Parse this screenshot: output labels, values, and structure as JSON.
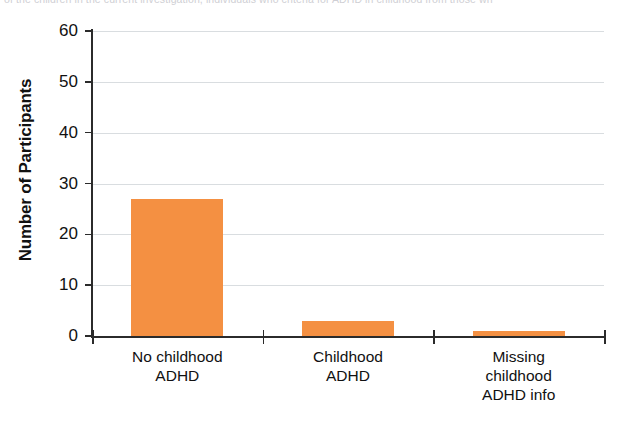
{
  "caption": {
    "text": "of the children in the current investigation, individuals who criteria for ADHD in childhood from those wh"
  },
  "chart_data": {
    "type": "bar",
    "title": "",
    "xlabel": "",
    "ylabel": "Number of Participants",
    "categories": [
      "No childhood ADHD",
      "Childhood ADHD",
      "Missing childhood ADHD info"
    ],
    "category_lines": [
      [
        "No childhood",
        "ADHD"
      ],
      [
        "Childhood",
        "ADHD"
      ],
      [
        "Missing",
        "childhood",
        "ADHD info"
      ]
    ],
    "values": [
      27,
      3,
      1
    ],
    "ylim": [
      0,
      60
    ],
    "yticks": [
      0,
      10,
      20,
      30,
      40,
      50,
      60
    ],
    "ytick_labels": [
      "0",
      "10",
      "20",
      "30",
      "40",
      "50",
      "60"
    ],
    "grid": true,
    "legend": "none",
    "bar_color": "#F49042",
    "grid_color": "#D9DDE0",
    "axis_color": "#2B2B2B"
  }
}
